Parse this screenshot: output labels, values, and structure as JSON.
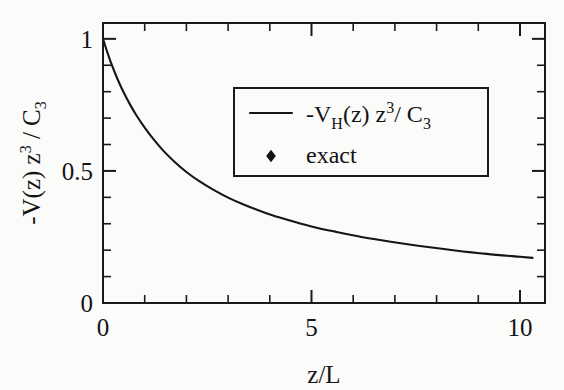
{
  "figure": {
    "background": "#fbfbfa",
    "ink_color": "#151515",
    "width": 564,
    "height": 390
  },
  "chart_data": {
    "type": "line",
    "title": "",
    "xlabel": "z/L",
    "ylabel": "-V(z) z3 / C3",
    "ylabel_parts": {
      "lead": "-V(z) z",
      "exp": "3",
      "mid": " / C",
      "sub": "3"
    },
    "xlim": [
      0,
      10.6
    ],
    "ylim": [
      0,
      1.06
    ],
    "xticks": [
      0,
      5,
      10
    ],
    "xticklabels": [
      "0",
      "5",
      "10"
    ],
    "xminor_step": 1,
    "yticks": [
      0,
      0.5,
      1
    ],
    "yticklabels": [
      "0",
      "0.5",
      "1"
    ],
    "yminor_step": 0.1,
    "grid": false,
    "frame": "box",
    "ticks_direction": "in",
    "ticks_on_all_sides": true,
    "legend": {
      "position": "upper-right-inset",
      "border": true,
      "entries": [
        {
          "marker": "line",
          "label": "-VH(z) z3/ C3",
          "label_parts": {
            "lead": "-V",
            "sub1": "H",
            "mid": "(z) z",
            "exp": "3",
            "tail": "/ C",
            "sub2": "3"
          }
        },
        {
          "marker": "diamond",
          "label": "exact",
          "label_parts": {
            "lead": "exact"
          }
        }
      ]
    },
    "series": [
      {
        "name": "-VH(z) z3/ C3",
        "render": "line",
        "x": [
          0.0,
          0.05,
          0.1,
          0.15,
          0.2,
          0.3,
          0.4,
          0.5,
          0.65,
          0.8,
          1.0,
          1.2,
          1.45,
          1.7,
          2.0,
          2.3,
          2.6,
          3.0,
          3.4,
          3.9,
          4.4,
          5.0,
          5.6,
          6.2,
          6.9,
          7.6,
          8.4,
          9.2,
          10.0,
          10.3
        ],
        "y": [
          1.0,
          0.975,
          0.951,
          0.928,
          0.906,
          0.866,
          0.829,
          0.796,
          0.751,
          0.711,
          0.664,
          0.622,
          0.576,
          0.537,
          0.496,
          0.462,
          0.433,
          0.399,
          0.371,
          0.341,
          0.316,
          0.29,
          0.269,
          0.25,
          0.232,
          0.216,
          0.2,
          0.186,
          0.175,
          0.171
        ]
      },
      {
        "name": "exact",
        "render": "markers",
        "marker": "diamond",
        "x": [
          0.0,
          0.03,
          0.06,
          0.09,
          0.12,
          0.16,
          0.2,
          0.25,
          0.3,
          0.36,
          0.43,
          0.5,
          0.6,
          0.72,
          0.85,
          1.0,
          1.2,
          1.42,
          1.68,
          2.0,
          2.35,
          2.75,
          3.4,
          5.1,
          6.8,
          8.5,
          10.2
        ],
        "y": [
          1.0,
          0.985,
          0.97,
          0.956,
          0.942,
          0.925,
          0.908,
          0.888,
          0.868,
          0.845,
          0.82,
          0.796,
          0.764,
          0.729,
          0.696,
          0.664,
          0.622,
          0.581,
          0.541,
          0.496,
          0.456,
          0.422,
          0.367,
          0.287,
          0.242,
          0.212,
          0.19
        ]
      }
    ]
  }
}
